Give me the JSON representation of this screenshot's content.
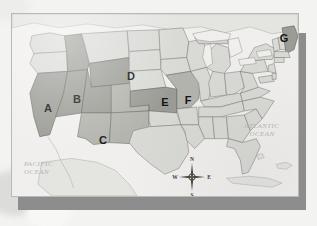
{
  "map": {
    "title": "United States Map with Lettered States",
    "projection_note": "contiguous united states",
    "colors": {
      "paper": "#f0efed",
      "land_light": "#d9d9d6",
      "land_mid": "#cfcfcb",
      "state_shade_light": "#b4b4ae",
      "state_shade_dark": "#9a9a94",
      "border_line": "#7d7d78",
      "outline": "#6e6e69",
      "water": "#f0efed",
      "label_text": "#151515",
      "ocean_text": "#b6b6b2",
      "card_shadow": "#8d8d8d",
      "card_border": "#b9b9b6",
      "page_background": "#f3f3f2"
    },
    "ocean_labels": [
      {
        "id": "pacific",
        "text": "PACIFIC\nOCEAN"
      },
      {
        "id": "atlantic",
        "text": "ATLANTIC\nOCEAN"
      }
    ],
    "state_labels": [
      {
        "letter": "A",
        "state": "California",
        "x": 36,
        "y": 94,
        "shade": "dark"
      },
      {
        "letter": "B",
        "state": "Idaho",
        "x": 65,
        "y": 85,
        "shade": "dark"
      },
      {
        "letter": "C",
        "state": "Arizona",
        "x": 91,
        "y": 126,
        "shade": "light"
      },
      {
        "letter": "D",
        "state": "South Dakota",
        "x": 119,
        "y": 62,
        "shade": "light"
      },
      {
        "letter": "E",
        "state": "Kansas",
        "x": 153,
        "y": 104,
        "shade": "dark"
      },
      {
        "letter": "F",
        "state": "Missouri",
        "x": 176,
        "y": 102,
        "shade": "light"
      },
      {
        "letter": "G",
        "state": "Maine",
        "x": 272,
        "y": 31,
        "shade": "dark"
      }
    ],
    "compass": {
      "north": "N",
      "south": "S",
      "east": "E",
      "west": "W"
    }
  }
}
